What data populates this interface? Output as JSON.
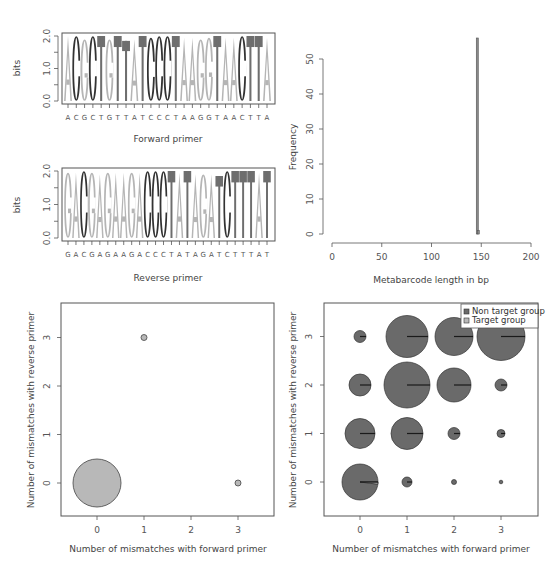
{
  "colors": {
    "A": "#b5b5b5",
    "G": "#b5b5b5",
    "C": "#333333",
    "T": "#6e6e6e",
    "axis": "#555555",
    "histogram_bar": "#8a8a8a",
    "target_group": "#b8b8b8",
    "non_target_group": "#6a6a6a"
  },
  "chart_data": [
    {
      "id": "forward-logo",
      "type": "sequence-logo",
      "title": "",
      "xlabel": "Forward primer",
      "ylabel": "bits",
      "ylim": [
        0,
        2
      ],
      "yticks": [
        "0.0",
        "1.0",
        "2.0"
      ],
      "sequence": [
        "A",
        "C",
        "G",
        "C",
        "T",
        "G",
        "T",
        "T",
        "A",
        "T",
        "C",
        "C",
        "C",
        "T",
        "A",
        "A",
        "G",
        "G",
        "T",
        "A",
        "A",
        "C",
        "T",
        "T",
        "A"
      ],
      "heights": [
        2.0,
        2.0,
        1.9,
        2.0,
        2.0,
        1.9,
        2.0,
        1.85,
        1.9,
        2.0,
        1.95,
        2.0,
        2.0,
        2.0,
        1.95,
        1.95,
        1.9,
        1.95,
        2.0,
        1.95,
        1.95,
        2.0,
        2.0,
        2.0,
        1.95
      ]
    },
    {
      "id": "reverse-logo",
      "type": "sequence-logo",
      "title": "",
      "xlabel": "Reverse primer",
      "ylabel": "bits",
      "ylim": [
        0,
        2
      ],
      "yticks": [
        "0.0",
        "1.0",
        "2.0"
      ],
      "sequence": [
        "G",
        "A",
        "C",
        "G",
        "A",
        "G",
        "A",
        "A",
        "G",
        "A",
        "C",
        "C",
        "C",
        "T",
        "A",
        "T",
        "A",
        "G",
        "A",
        "T",
        "C",
        "T",
        "T",
        "T",
        "A",
        "T"
      ],
      "heights": [
        1.95,
        1.95,
        2.0,
        1.95,
        1.9,
        1.95,
        1.95,
        1.95,
        1.95,
        1.95,
        2.0,
        2.0,
        2.0,
        2.0,
        1.95,
        2.0,
        1.9,
        1.9,
        1.9,
        1.85,
        2.0,
        2.0,
        2.0,
        2.0,
        1.95,
        2.0
      ]
    },
    {
      "id": "length-histogram",
      "type": "bar",
      "title": "",
      "xlabel": "Metabarcode length in bp",
      "ylabel": "Frequency",
      "xlim": [
        0,
        200
      ],
      "ylim": [
        0,
        56
      ],
      "xticks": [
        "0",
        "50",
        "100",
        "150",
        "200"
      ],
      "yticks": [
        "0",
        "10",
        "20",
        "30",
        "40",
        "50"
      ],
      "bars": [
        {
          "x": 145,
          "width": 1,
          "value": 56
        },
        {
          "x": 146,
          "width": 1,
          "value": 1
        }
      ]
    },
    {
      "id": "mismatch-target",
      "type": "scatter",
      "title": "",
      "xlabel": "Number of mismatches with forward primer",
      "ylabel": "Number of mismatches with reverse primer",
      "xticks": [
        "0",
        "1",
        "2",
        "3"
      ],
      "yticks": [
        "0",
        "1",
        "2",
        "3"
      ],
      "points": [
        {
          "x": 0,
          "y": 0,
          "radius": 24
        },
        {
          "x": 1,
          "y": 3,
          "radius": 3
        },
        {
          "x": 3,
          "y": 0,
          "radius": 3
        }
      ]
    },
    {
      "id": "mismatch-pies",
      "type": "scatter-pie",
      "title": "",
      "xlabel": "Number of mismatches with forward primer",
      "ylabel": "Number of mismatches with reverse primer",
      "xticks": [
        "0",
        "1",
        "2",
        "3"
      ],
      "yticks": [
        "0",
        "1",
        "2",
        "3"
      ],
      "legend": [
        "Non target group",
        "Target group"
      ],
      "legend_position": "top-right",
      "points": [
        {
          "x": 0,
          "y": 3,
          "radius": 6,
          "target_fraction": 0.0
        },
        {
          "x": 1,
          "y": 3,
          "radius": 21,
          "target_fraction": 0.0
        },
        {
          "x": 2,
          "y": 3,
          "radius": 19,
          "target_fraction": 0.0
        },
        {
          "x": 3,
          "y": 3,
          "radius": 24,
          "target_fraction": 0.0
        },
        {
          "x": 0,
          "y": 2,
          "radius": 11,
          "target_fraction": 0.0
        },
        {
          "x": 1,
          "y": 2,
          "radius": 23,
          "target_fraction": 0.0
        },
        {
          "x": 2,
          "y": 2,
          "radius": 17,
          "target_fraction": 0.0
        },
        {
          "x": 3,
          "y": 2,
          "radius": 6,
          "target_fraction": 0.0
        },
        {
          "x": 0,
          "y": 1,
          "radius": 15,
          "target_fraction": 0.0
        },
        {
          "x": 1,
          "y": 1,
          "radius": 16,
          "target_fraction": 0.0
        },
        {
          "x": 2,
          "y": 1,
          "radius": 6,
          "target_fraction": 0.0
        },
        {
          "x": 3,
          "y": 1,
          "radius": 4,
          "target_fraction": 0.0
        },
        {
          "x": 0,
          "y": 0,
          "radius": 18,
          "target_fraction": 0.02
        },
        {
          "x": 1,
          "y": 0,
          "radius": 5,
          "target_fraction": 0.0
        },
        {
          "x": 2,
          "y": 0,
          "radius": 2.5,
          "target_fraction": 0.0
        },
        {
          "x": 3,
          "y": 0,
          "radius": 1.8,
          "target_fraction": 0.0
        }
      ]
    }
  ]
}
